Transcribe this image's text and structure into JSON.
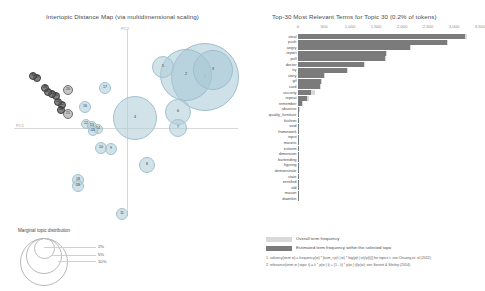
{
  "left_panel": {
    "title": "Intertopic Distance Map (via multidimensional scaling)",
    "x_axis_label": "PC1",
    "y_axis_label": "PC2",
    "legend": {
      "title": "Marginal topic distribution",
      "sizes": [
        "2%",
        "5%",
        "10%"
      ]
    },
    "topics": [
      {
        "id": "1",
        "x": 205,
        "y": 77,
        "r": 34,
        "size": "big"
      },
      {
        "id": "2",
        "x": 186,
        "y": 75,
        "r": 26,
        "size": "big"
      },
      {
        "id": "3",
        "x": 213,
        "y": 70,
        "r": 20,
        "size": "big"
      },
      {
        "id": "4",
        "x": 135,
        "y": 118,
        "r": 22,
        "size": "mid"
      },
      {
        "id": "5",
        "x": 163,
        "y": 67,
        "r": 11,
        "size": "mid"
      },
      {
        "id": "6",
        "x": 178,
        "y": 112,
        "r": 13,
        "size": "mid"
      },
      {
        "id": "7",
        "x": 178,
        "y": 128,
        "r": 9,
        "size": "mid"
      },
      {
        "id": "8",
        "x": 147,
        "y": 165,
        "r": 8,
        "size": "mid"
      },
      {
        "id": "9",
        "x": 111,
        "y": 149,
        "r": 6,
        "size": "mid"
      },
      {
        "id": "10",
        "x": 101,
        "y": 148,
        "r": 6,
        "size": "mid"
      },
      {
        "id": "11",
        "x": 122,
        "y": 214,
        "r": 6,
        "size": "mid"
      },
      {
        "id": "12",
        "x": 86,
        "y": 124,
        "r": 5,
        "size": "mid"
      },
      {
        "id": "13",
        "x": 92,
        "y": 126,
        "r": 5,
        "size": "mid"
      },
      {
        "id": "14",
        "x": 98,
        "y": 129,
        "r": 5,
        "size": "mid"
      },
      {
        "id": "15",
        "x": 93,
        "y": 131,
        "r": 5,
        "size": "mid"
      },
      {
        "id": "16",
        "x": 85,
        "y": 107,
        "r": 6,
        "size": "mid"
      },
      {
        "id": "17",
        "x": 105,
        "y": 88,
        "r": 6,
        "size": "mid"
      },
      {
        "id": "18",
        "x": 78,
        "y": 180,
        "r": 6,
        "size": "mid"
      },
      {
        "id": "19",
        "x": 78,
        "y": 186,
        "r": 6,
        "size": "mid"
      },
      {
        "id": "20",
        "x": 68,
        "y": 90,
        "r": 5,
        "size": "small"
      },
      {
        "id": "21",
        "x": 68,
        "y": 114,
        "r": 5,
        "size": "small"
      },
      {
        "id": "22",
        "x": 62,
        "y": 105,
        "r": 4,
        "size": "tiny"
      },
      {
        "id": "23",
        "x": 58,
        "y": 102,
        "r": 4,
        "size": "tiny"
      },
      {
        "id": "24",
        "x": 61,
        "y": 110,
        "r": 4,
        "size": "tiny"
      },
      {
        "id": "25",
        "x": 56,
        "y": 96,
        "r": 4,
        "size": "tiny"
      },
      {
        "id": "26",
        "x": 52,
        "y": 94,
        "r": 4,
        "size": "tiny"
      },
      {
        "id": "27",
        "x": 48,
        "y": 92,
        "r": 4,
        "size": "tiny"
      },
      {
        "id": "28",
        "x": 45,
        "y": 88,
        "r": 4,
        "size": "tiny"
      },
      {
        "id": "29",
        "x": 37,
        "y": 78,
        "r": 4,
        "size": "tiny"
      },
      {
        "id": "30",
        "x": 33,
        "y": 76,
        "r": 4,
        "size": "tiny"
      }
    ]
  },
  "right_panel": {
    "title": "Top-30 Most Relevant Terms for Topic 30 (0.2% of tokens)",
    "legend": [
      {
        "key": "overall",
        "label": "Overall term frequency",
        "color": "#d9d9d9"
      },
      {
        "key": "selected",
        "label": "Estimated term frequency within the selected topic",
        "color": "#7b7b7b"
      }
    ],
    "notes": [
      "1. saliency(term w) = frequency(w) * [sum_t p(t | w) * log(p(t | w)/p(t))] for topics t; see Chuang et. al (2012)",
      "2. relevance(term w | topic t) = λ * p(w | t) + (1 - λ) * p(w | t)/p(w); see Sievert & Shirley (2014)"
    ]
  },
  "chart_data": {
    "type": "bar",
    "title": "Top-30 Most Relevant Terms for Topic 30 (0.2% of tokens)",
    "xlabel": "",
    "ylabel": "",
    "xlim": [
      0,
      3500
    ],
    "xticks": [
      0,
      500,
      1000,
      1500,
      2000,
      2500,
      3000,
      3500
    ],
    "xtick_labels": [
      "0",
      "500",
      "1,000",
      "1,500",
      "2,000",
      "2,500",
      "3,000",
      "3,500"
    ],
    "grid": false,
    "legend_position": "bottom-left",
    "orientation": "horizontal",
    "categories": [
      "steal",
      "push",
      "angry",
      "report",
      "pull",
      "doctor",
      "try",
      "story",
      "gif",
      "card",
      "security",
      "repeat",
      "remember",
      "absence",
      "quality_furniture",
      "fashion",
      "void",
      "framework",
      "input",
      "mounts",
      "esteem",
      "dimension",
      "bartending",
      "figuring",
      "demonstrate",
      "state",
      "enrolled",
      "old",
      "mason",
      "dawnkin"
    ],
    "series": [
      {
        "name": "Overall term frequency",
        "values": [
          3250,
          2880,
          2180,
          1720,
          1690,
          1290,
          960,
          520,
          460,
          440,
          330,
          210,
          90,
          30,
          22,
          18,
          15,
          13,
          12,
          11,
          10,
          9,
          9,
          8,
          8,
          7,
          7,
          6,
          6,
          5
        ]
      },
      {
        "name": "Estimated term frequency within the selected topic",
        "values": [
          3220,
          2860,
          2160,
          1700,
          1670,
          1270,
          945,
          505,
          450,
          430,
          255,
          165,
          70,
          22,
          16,
          13,
          11,
          9,
          9,
          8,
          7,
          7,
          6,
          6,
          6,
          5,
          5,
          4,
          4,
          3
        ]
      }
    ]
  }
}
